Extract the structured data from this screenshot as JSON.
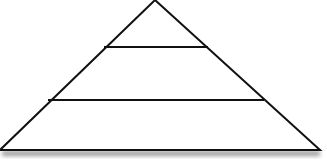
{
  "diagram": {
    "type": "pyramid",
    "levels": 3,
    "colors": {
      "stroke": "#111111",
      "fill": "#ffffff",
      "shadow": "#9a9a9a"
    },
    "labels": []
  }
}
